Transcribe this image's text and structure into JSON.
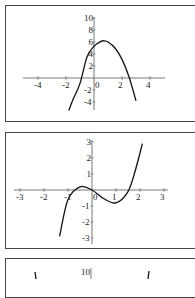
{
  "chart_data": [
    {
      "type": "line",
      "title": "",
      "xlabel": "",
      "ylabel": "",
      "xlim": [
        -5,
        5
      ],
      "ylim": [
        -5,
        10
      ],
      "x_ticks": [
        "-4",
        "-2",
        "0",
        "2",
        "4"
      ],
      "y_ticks": [
        "10",
        "8",
        "6",
        "4",
        "2",
        "-2",
        "-4"
      ],
      "grid": false,
      "description": "Downward-opening parabola, vertex about (0.7, 6.2), y-intercept about 5.3, x-intercepts about -1.1 and 2.5",
      "series": [
        {
          "name": "parabola",
          "x": [
            -1.8,
            -1.5,
            -1.0,
            -0.5,
            0,
            0.5,
            0.7,
            1.0,
            1.5,
            2.0,
            2.5,
            3.0
          ],
          "y": [
            -5.4,
            -3.6,
            -0.9,
            3.5,
            5.3,
            6.1,
            6.2,
            6.0,
            5.0,
            3.1,
            0.2,
            -3.8
          ]
        }
      ]
    },
    {
      "type": "line",
      "title": "",
      "xlabel": "",
      "ylabel": "",
      "xlim": [
        -3,
        3
      ],
      "ylim": [
        -3,
        3
      ],
      "x_ticks": [
        "-3",
        "-2",
        "-1",
        "0",
        "1",
        "2",
        "3"
      ],
      "y_ticks": [
        "3",
        "2",
        "1",
        "-1",
        "-2",
        "-3"
      ],
      "grid": false,
      "description": "Cubic with local max near (-0.5, 0.2), local min near (1, -0.8), x-intercepts near -1, 0 and 1.55",
      "series": [
        {
          "name": "cubic",
          "x": [
            -1.35,
            -1.0,
            -0.5,
            0,
            0.5,
            1.0,
            1.5,
            1.8,
            2.1
          ],
          "y": [
            -2.9,
            -0.6,
            0.2,
            0.0,
            -0.55,
            -0.8,
            -0.1,
            1.2,
            2.9
          ]
        }
      ]
    },
    {
      "type": "line",
      "title": "",
      "x_ticks": [],
      "y_ticks": [
        "10"
      ],
      "description": "Third panel, cropped: only the y tick label 10 and two steep curve segments are visible",
      "series": []
    }
  ],
  "panels": [
    {
      "x_ticks": [
        {
          "label": "-4",
          "x": -4
        },
        {
          "label": "-2",
          "x": -2
        },
        {
          "label": "2",
          "x": 2
        },
        {
          "label": "4",
          "x": 4
        }
      ],
      "origin_label": "0",
      "y_ticks": [
        {
          "label": "10",
          "y": 10
        },
        {
          "label": "8",
          "y": 8
        },
        {
          "label": "6",
          "y": 6
        },
        {
          "label": "4",
          "y": 4
        },
        {
          "label": "2",
          "y": 2
        },
        {
          "label": "-2",
          "y": -2
        },
        {
          "label": "-4",
          "y": -4
        }
      ]
    },
    {
      "x_ticks": [
        {
          "label": "-3",
          "x": -3
        },
        {
          "label": "-2",
          "x": -2
        },
        {
          "label": "-1",
          "x": -1
        },
        {
          "label": "1",
          "x": 1
        },
        {
          "label": "2",
          "x": 2
        },
        {
          "label": "3",
          "x": 3
        }
      ],
      "origin_label": "0",
      "y_ticks": [
        {
          "label": "3",
          "y": 3
        },
        {
          "label": "2",
          "y": 2
        },
        {
          "label": "1",
          "y": 1
        },
        {
          "label": "-1",
          "y": -1
        },
        {
          "label": "-2",
          "y": -2
        },
        {
          "label": "-3",
          "y": -3
        }
      ]
    },
    {
      "y_top_label": "10"
    }
  ]
}
